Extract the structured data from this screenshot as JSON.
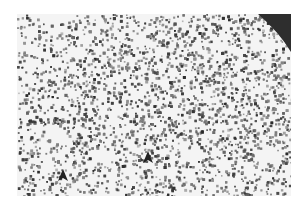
{
  "image": {
    "description": "Grayscale histology micrograph of densely cellular tissue with scattered clear vacuoles and two arrowheads",
    "background": "#f4f4f4",
    "cell_color": "#4a4a4a",
    "corner_region_color": "#2e2e2e",
    "arrowheads": [
      {
        "x": 46,
        "y": 164,
        "color": "#222222"
      },
      {
        "x": 131,
        "y": 146,
        "color": "#222222"
      }
    ],
    "vacuoles": [
      {
        "x": 40,
        "y": 121,
        "rx": 10,
        "ry": 8
      },
      {
        "x": 84,
        "y": 141,
        "rx": 10,
        "ry": 8
      },
      {
        "x": 175,
        "y": 141,
        "rx": 11,
        "ry": 7
      },
      {
        "x": 153,
        "y": 157,
        "rx": 6,
        "ry": 5
      },
      {
        "x": 248,
        "y": 141,
        "rx": 12,
        "ry": 8
      },
      {
        "x": 205,
        "y": 150,
        "rx": 7,
        "ry": 6
      },
      {
        "x": 124,
        "y": 26,
        "rx": 9,
        "ry": 6
      },
      {
        "x": 60,
        "y": 40,
        "rx": 7,
        "ry": 5
      }
    ]
  }
}
